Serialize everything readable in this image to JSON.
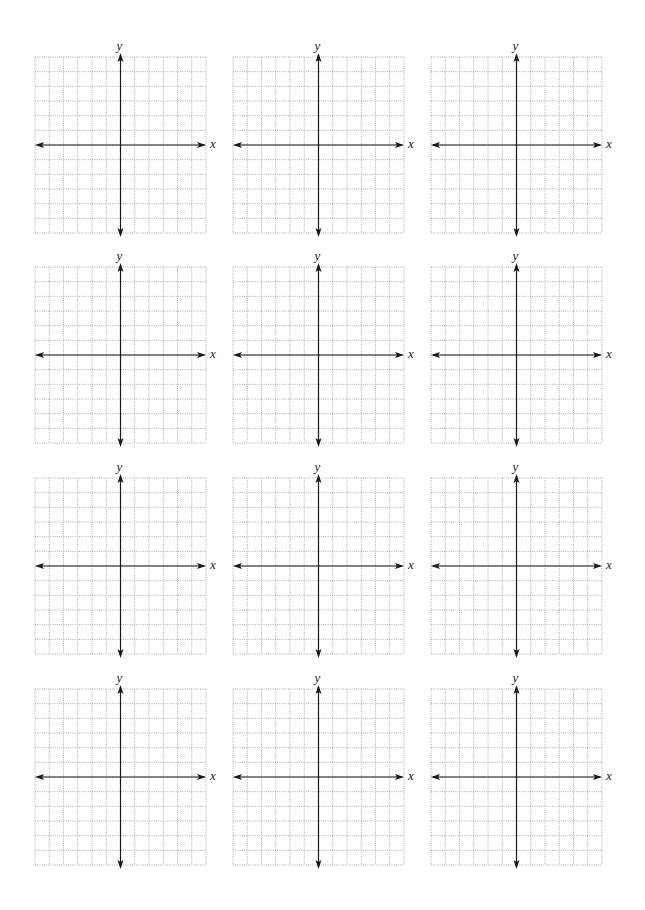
{
  "page": {
    "background": "#ffffff",
    "grid_line_color": "#9a9a9a",
    "axis_color": "#1a1a1a"
  },
  "layout": {
    "rows": 4,
    "cols": 3,
    "col_lefts": [
      35,
      233,
      431
    ],
    "row_tops": [
      57,
      267,
      478,
      689
    ],
    "grid_width": 171,
    "grid_height": 176,
    "cells_x": 12,
    "cells_y": 12
  },
  "graphs": [
    {
      "x_label": "x",
      "y_label": "y"
    },
    {
      "x_label": "x",
      "y_label": "y"
    },
    {
      "x_label": "x",
      "y_label": "y"
    },
    {
      "x_label": "x",
      "y_label": "y"
    },
    {
      "x_label": "x",
      "y_label": "y"
    },
    {
      "x_label": "x",
      "y_label": "y"
    },
    {
      "x_label": "x",
      "y_label": "y"
    },
    {
      "x_label": "x",
      "y_label": "y"
    },
    {
      "x_label": "x",
      "y_label": "y"
    },
    {
      "x_label": "x",
      "y_label": "y"
    },
    {
      "x_label": "x",
      "y_label": "y"
    },
    {
      "x_label": "x",
      "y_label": "y"
    }
  ]
}
